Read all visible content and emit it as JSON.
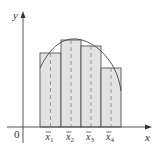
{
  "diagram": {
    "axes": {
      "x_label": "x",
      "y_label": "y",
      "origin_label": "0",
      "color": "#444444"
    },
    "rectangles": [
      {
        "x0": 40,
        "x1": 61,
        "top": 53,
        "midpoint_label": "x",
        "subscript": "1"
      },
      {
        "x0": 61,
        "x1": 81,
        "top": 40,
        "midpoint_label": "x",
        "subscript": "2"
      },
      {
        "x0": 81,
        "x1": 101,
        "top": 46,
        "midpoint_label": "x",
        "subscript": "3"
      },
      {
        "x0": 101,
        "x1": 121,
        "top": 68,
        "midpoint_label": "x",
        "subscript": "4"
      }
    ],
    "baseline_y": 127,
    "colors": {
      "rect_fill": "#e3e3e3",
      "rect_stroke": "#555555",
      "curve": "#444444",
      "dashed": "#888888"
    }
  }
}
